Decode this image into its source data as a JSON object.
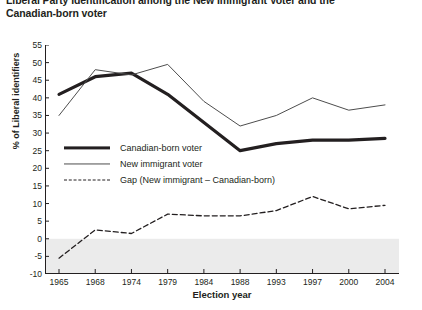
{
  "title": {
    "line1": "Liberal Party Identification among the New Immigrant Voter and the",
    "line2": "Canadian-born voter"
  },
  "axes": {
    "xlabel": "Election year",
    "ylabel": "% of Liberal identifiers"
  },
  "legend": {
    "items": [
      {
        "label": "Canadian-born voter",
        "style": "thick-solid",
        "color": "#231f20"
      },
      {
        "label": "New immigrant voter",
        "style": "thin-solid",
        "color": "#4d4d4d"
      },
      {
        "label": "Gap (New immigrant – Canadian-born)",
        "style": "dashed",
        "color": "#231f20"
      }
    ]
  },
  "chart_data": {
    "type": "line",
    "title": "Liberal Party Identification among the New Immigrant Voter and the Canadian-born voter",
    "xlabel": "Election year",
    "ylabel": "% of Liberal identifiers",
    "categories": [
      "1965",
      "1968",
      "1974",
      "1979",
      "1984",
      "1988",
      "1993",
      "1997",
      "2000",
      "2004"
    ],
    "x_tick_labels": [
      "1965",
      "1968",
      "1974",
      "1979",
      "1984",
      "1988",
      "1993",
      "1997",
      "2000",
      "2004"
    ],
    "y_tick_labels": [
      "-10",
      "-5",
      "0",
      "5",
      "10",
      "15",
      "20",
      "25",
      "30",
      "35",
      "40",
      "45",
      "50",
      "55"
    ],
    "ylim": [
      -10,
      55
    ],
    "y_tick_step": 5,
    "grid": false,
    "legend_position": "inside-left-middle",
    "shaded_band": {
      "from": -10,
      "to": 0,
      "color": "#ebebeb"
    },
    "series": [
      {
        "name": "Canadian-born voter",
        "style": "thick-solid",
        "color": "#231f20",
        "values": [
          41,
          46,
          47,
          41,
          33,
          25,
          27,
          28,
          28,
          28.5
        ]
      },
      {
        "name": "New immigrant voter",
        "style": "thin-solid",
        "color": "#4d4d4d",
        "values": [
          35,
          48,
          46.5,
          49.5,
          39,
          32,
          35,
          40,
          36.5,
          38
        ]
      },
      {
        "name": "Gap (New immigrant – Canadian-born)",
        "style": "dashed",
        "color": "#231f20",
        "values": [
          -5.5,
          2.5,
          1.5,
          7,
          6.5,
          6.5,
          8,
          12,
          8.5,
          9.5
        ]
      }
    ]
  }
}
